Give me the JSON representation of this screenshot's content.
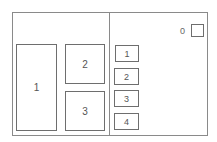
{
  "left_panel": {
    "boxes": [
      {
        "label": "1"
      },
      {
        "label": "2"
      },
      {
        "label": "3"
      }
    ]
  },
  "right_panel": {
    "counter_label": "0",
    "buttons": [
      {
        "label": "1"
      },
      {
        "label": "2"
      },
      {
        "label": "3"
      },
      {
        "label": "4"
      }
    ]
  }
}
